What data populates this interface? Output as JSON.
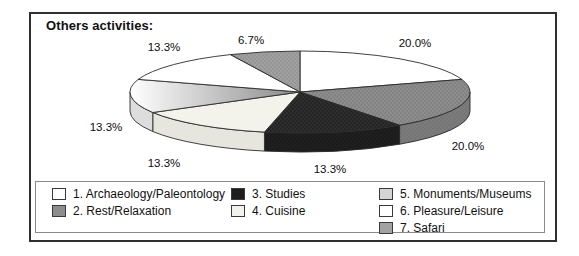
{
  "title": "Others activities:",
  "chart_data": {
    "type": "pie",
    "style": "3d",
    "title": "Others activities:",
    "start_angle_deg": 0,
    "direction": "clockwise",
    "legend_position": "bottom",
    "slices": [
      {
        "name": "Archaeology/Paleontology",
        "value": 20.0,
        "label": "20.0%",
        "fill": "#ffffff",
        "fill_type": "solid",
        "side": "#e9e9e9"
      },
      {
        "name": "Rest/Relaxation",
        "value": 20.0,
        "label": "20.0%",
        "fill": "#8d8d8d",
        "fill_type": "stipple",
        "dot": "#6e6e6e",
        "side": "#7b7b7b"
      },
      {
        "name": "Studies",
        "value": 13.3,
        "label": "13.3%",
        "fill": "#2e2e2e",
        "fill_type": "stipple",
        "dot": "#151515",
        "side": "#1f1f1f"
      },
      {
        "name": "Cuisine",
        "value": 13.3,
        "label": "13.3%",
        "fill": "#f3f3ec",
        "fill_type": "solid",
        "side": "#e6e6de"
      },
      {
        "name": "Monuments/Museums",
        "value": 13.3,
        "label": "13.3%",
        "fill": "#ffffff",
        "fill_type": "gradient",
        "fill2": "#8a8a8a",
        "side": "#dddddd"
      },
      {
        "name": "Pleasure/Leisure",
        "value": 13.3,
        "label": "13.3%",
        "fill": "#ffffff",
        "fill_type": "solid",
        "side": "#e9e9e9"
      },
      {
        "name": "Safari",
        "value": 6.7,
        "label": "6.7%",
        "fill": "#a0a0a0",
        "fill_type": "stipple",
        "dot": "#858585",
        "side": "#8d8d8d"
      }
    ],
    "legend": {
      "columns": 3,
      "items": [
        {
          "label": "1. Archaeology/Paleontology",
          "swatch": "#ffffff"
        },
        {
          "label": "2. Rest/Relaxation",
          "swatch": "#8d8d8d"
        },
        {
          "label": "3. Studies",
          "swatch": "#1e1e1e"
        },
        {
          "label": "4. Cuisine",
          "swatch": "#f2f2ec"
        },
        {
          "label": "5. Monuments/Museums",
          "swatch": "#d4d4d4"
        },
        {
          "label": "6. Pleasure/Leisure",
          "swatch": "#ffffff"
        },
        {
          "label": "7. Safari",
          "swatch": "#a2a2a2"
        }
      ]
    }
  }
}
